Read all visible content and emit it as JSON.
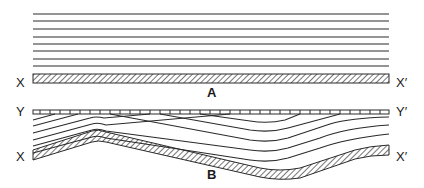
{
  "diagram": {
    "panels": [
      {
        "id": "A",
        "label": "A",
        "description": "Horizontal parallel strata above a horizontal hatched basement surface",
        "basement_left_label": "X",
        "basement_right_label": "X′",
        "strata_count": 8
      },
      {
        "id": "B",
        "label": "B",
        "description": "Strata draped over an undulating hatched basement, truncated at top by a flat erosional surface",
        "surface_left_label": "Y",
        "surface_right_label": "Y′",
        "basement_left_label": "X",
        "basement_right_label": "X′",
        "strata_count": 7
      }
    ],
    "colors": {
      "line": "#2a2a2a",
      "background": "#ffffff"
    }
  },
  "labels": {
    "a_x_left": "X",
    "a_x_right": "X′",
    "a_panel": "A",
    "b_y_left": "Y",
    "b_y_right": "Y′",
    "b_x_left": "X",
    "b_x_right": "X′",
    "b_panel": "B"
  }
}
